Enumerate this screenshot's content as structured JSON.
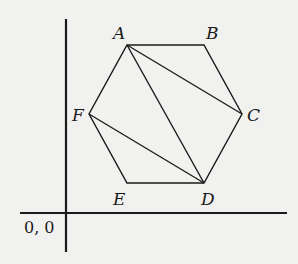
{
  "diagram": {
    "type": "regular hexagon on coordinate axes",
    "origin_label": "0, 0",
    "vertices": [
      {
        "name": "A",
        "x": 127,
        "y": 45
      },
      {
        "name": "B",
        "x": 204,
        "y": 45
      },
      {
        "name": "C",
        "x": 242,
        "y": 114
      },
      {
        "name": "D",
        "x": 204,
        "y": 183
      },
      {
        "name": "E",
        "x": 127,
        "y": 183
      },
      {
        "name": "F",
        "x": 89,
        "y": 114
      }
    ],
    "edges": [
      "AB",
      "BC",
      "CD",
      "DE",
      "EF",
      "FA"
    ],
    "diagonals": [
      "AC",
      "AD",
      "FD"
    ],
    "labels": {
      "A": "A",
      "B": "B",
      "C": "C",
      "D": "D",
      "E": "E",
      "F": "F"
    },
    "colors": {
      "background": "#f1f1ef",
      "stroke": "#1a1a1a"
    }
  }
}
